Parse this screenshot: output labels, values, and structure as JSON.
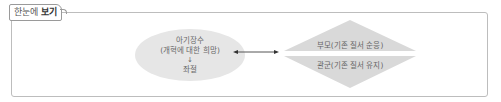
{
  "tab": {
    "label_regular": "한눈에 ",
    "label_bold": "보기"
  },
  "diagram": {
    "left_node": {
      "shape": "ellipse",
      "line1": "아기장수",
      "line2": "(개혁에 대한 희망)",
      "arrow": "↓",
      "line3": "좌절",
      "fill": "#e6e6e6"
    },
    "connector": {
      "type": "double-headed-arrow",
      "color": "#333333"
    },
    "right_nodes": [
      {
        "shape": "triangle-up",
        "label": "부모(기존 질서 순응)",
        "fill": "#d9d9d9"
      },
      {
        "shape": "triangle-down",
        "label": "관군(기존 질서 유지)",
        "fill": "#d9d9d9"
      }
    ]
  },
  "colors": {
    "frame_border": "#bdbdbd",
    "text": "#666666"
  }
}
